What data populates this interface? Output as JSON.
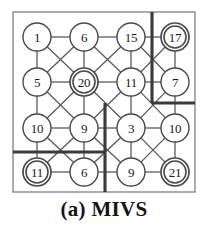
{
  "figure": {
    "caption": "(a) MIVS",
    "label": "(a)",
    "name": "MIVS"
  },
  "colors": {
    "background": "#ffffff",
    "node_stroke": "#4a4a4a",
    "node_fill": "#ffffff",
    "edge": "#5a5a5a",
    "label_text": "#1a1a1a",
    "box_border": "#8a8a8a",
    "partition_line": "#3a3a3a",
    "caption_text": "#151515"
  },
  "geometry": {
    "box": {
      "x": 13,
      "y": 12,
      "width": 182,
      "height": 180
    },
    "node_radius": 14,
    "node_inner_radius": 11,
    "columns_x": [
      37,
      84,
      131,
      175
    ],
    "rows_y": [
      37,
      82,
      128,
      172
    ]
  },
  "graph": {
    "type": "king-grid-4x4",
    "rows": 4,
    "cols": 4,
    "nodes": [
      {
        "id": "n00",
        "row": 0,
        "col": 0,
        "value": "1",
        "selected": false
      },
      {
        "id": "n01",
        "row": 0,
        "col": 1,
        "value": "6",
        "selected": false
      },
      {
        "id": "n02",
        "row": 0,
        "col": 2,
        "value": "15",
        "selected": false
      },
      {
        "id": "n03",
        "row": 0,
        "col": 3,
        "value": "17",
        "selected": true
      },
      {
        "id": "n10",
        "row": 1,
        "col": 0,
        "value": "5",
        "selected": false
      },
      {
        "id": "n11",
        "row": 1,
        "col": 1,
        "value": "20",
        "selected": true
      },
      {
        "id": "n12",
        "row": 1,
        "col": 2,
        "value": "11",
        "selected": false
      },
      {
        "id": "n13",
        "row": 1,
        "col": 3,
        "value": "7",
        "selected": false
      },
      {
        "id": "n20",
        "row": 2,
        "col": 0,
        "value": "10",
        "selected": false
      },
      {
        "id": "n21",
        "row": 2,
        "col": 1,
        "value": "9",
        "selected": false
      },
      {
        "id": "n22",
        "row": 2,
        "col": 2,
        "value": "3",
        "selected": false
      },
      {
        "id": "n23",
        "row": 2,
        "col": 3,
        "value": "10",
        "selected": false
      },
      {
        "id": "n30",
        "row": 3,
        "col": 0,
        "value": "11",
        "selected": true
      },
      {
        "id": "n31",
        "row": 3,
        "col": 1,
        "value": "6",
        "selected": false
      },
      {
        "id": "n32",
        "row": 3,
        "col": 2,
        "value": "9",
        "selected": false
      },
      {
        "id": "n33",
        "row": 3,
        "col": 3,
        "value": "21",
        "selected": true
      }
    ],
    "selected_values": [
      "17",
      "20",
      "11",
      "21"
    ],
    "partitions": [
      {
        "id": "p-right-vertical",
        "orientation": "vertical",
        "x": 152,
        "y1": 12,
        "y2": 103
      },
      {
        "id": "p-right-horizontal",
        "orientation": "horizontal",
        "y": 103,
        "x1": 152,
        "x2": 195
      },
      {
        "id": "p-center-vertical",
        "orientation": "vertical",
        "x": 105,
        "y1": 103,
        "y2": 192
      },
      {
        "id": "p-left-horizontal",
        "orientation": "horizontal",
        "y": 152,
        "x1": 13,
        "x2": 105
      }
    ]
  }
}
